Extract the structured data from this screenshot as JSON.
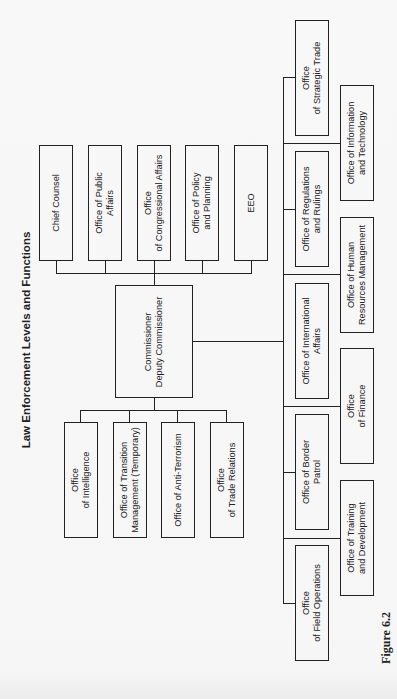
{
  "title": "Law Enforcement Levels and Functions",
  "figure_caption": "Figure 6.2",
  "root": {
    "label": "Commissioner\nDeputy Commissioner"
  },
  "staff_offices": [
    {
      "label": "Chief Counsel"
    },
    {
      "label": "Office of Public\nAffairs"
    },
    {
      "label": "Office\nof Congressional Affairs"
    },
    {
      "label": "Office of Policy\nand Planning"
    },
    {
      "label": "EEO"
    }
  ],
  "support_offices": [
    {
      "label": "Office\nof Intelligence"
    },
    {
      "label": "Office of Transition\nManagement (Temporary)"
    },
    {
      "label": "Office of Anti-Terrorism"
    },
    {
      "label": "Office\nof Trade Relations"
    }
  ],
  "operational_offices_inner": [
    {
      "label": "Office\nof Strategic Trade"
    },
    {
      "label": "Office of Regulations\nand Rulings"
    },
    {
      "label": "Office of International\nAffairs"
    },
    {
      "label": "Office of Border\nPatrol"
    },
    {
      "label": "Office\nof Field Operations"
    }
  ],
  "operational_offices_outer": [
    {
      "label": "Office of Information\nand Technology"
    },
    {
      "label": "Office of Human\nResources Management"
    },
    {
      "label": "Office\nof Finance"
    },
    {
      "label": "Office of Training\nand Development"
    }
  ]
}
